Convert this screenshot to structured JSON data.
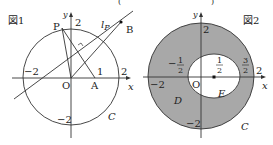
{
  "figure1": {
    "title": "図1",
    "axis_x": "x",
    "axis_y": "y",
    "origin": "O",
    "tick_neg2_x": "−2",
    "tick_2_x": "2",
    "tick_1_x": "1",
    "tick_2_y": "2",
    "tick_neg2_y": "−2",
    "point_P": "P",
    "point_A": "A",
    "point_B": "B",
    "line_label_main": "l",
    "line_label_sub": "P",
    "circle_label": "C"
  },
  "figure2": {
    "title": "図2",
    "axis_x": "x",
    "axis_y": "y",
    "origin": "O",
    "tick_neg2_x": "−2",
    "tick_2_x": "2",
    "tick_2_y": "2",
    "tick_neg2_y": "−2",
    "frac_neg_half_num": "1",
    "frac_neg_half_den": "2",
    "frac_neg_sign": "−",
    "frac_half_num": "1",
    "frac_half_den": "2",
    "frac_3half_num": "3",
    "frac_3half_den": "2",
    "region_D": "D",
    "region_E": "E",
    "circle_label": "C",
    "shade_color": "#a8a8a8"
  },
  "top_fragments": {
    "left": "(",
    "right": ")"
  }
}
